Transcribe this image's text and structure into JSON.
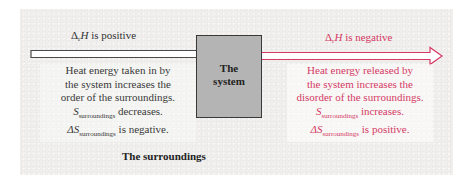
{
  "diagram": {
    "surroundings_label": "The surroundings",
    "system_label": "The\nsystem",
    "colors": {
      "endothermic": "#333333",
      "exothermic": "#d53a64",
      "system_fill": "#b4b4b4",
      "surroundings_fill": "#efeeec"
    },
    "left": {
      "delta_symbol": "Δ",
      "delta_sub": "r",
      "delta_var": "H",
      "delta_text": " is positive",
      "lines": [
        "Heat energy taken in by",
        "the system increases the",
        "order of the surroundings."
      ],
      "s_symbol": "S",
      "s_sub": "surroundings",
      "s_text": " decreases.",
      "ds_symbol": "ΔS",
      "ds_sub": "surroundings",
      "ds_text": " is negative."
    },
    "right": {
      "delta_symbol": "Δ",
      "delta_sub": "r",
      "delta_var": "H",
      "delta_text": " is negative",
      "lines": [
        "Heat energy released by",
        "the system increases the",
        "disorder of the surroundings."
      ],
      "s_symbol": "S",
      "s_sub": "surroundings",
      "s_text": " increases.",
      "ds_symbol": "ΔS",
      "ds_sub": "surroundings",
      "ds_text": " is positive."
    }
  }
}
